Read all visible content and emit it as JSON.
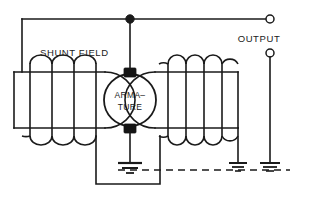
{
  "diagram": {
    "type": "electrical-schematic",
    "background_color": "#ffffff",
    "line_color": "#1a1a1a",
    "labels": {
      "shunt_field": "SHUNT FIELD",
      "output": "OUTPUT",
      "armature_line1": "ARMA–",
      "armature_line2": "TURE"
    },
    "components": {
      "armature": {
        "name": "ARMATURE",
        "shape": "circle",
        "center_x": 130,
        "center_y": 100,
        "radius": 26,
        "brush_top": "brush-top",
        "brush_bottom": "brush-bottom"
      },
      "shunt_field_coil": {
        "name": "SHUNT FIELD",
        "turns": 4,
        "position": "left"
      },
      "series_field_coil": {
        "name": "field coil",
        "turns": 5,
        "position": "right"
      },
      "terminals": [
        {
          "name": "output-terminal-top",
          "kind": "open-circle",
          "x": 270,
          "y": 19
        },
        {
          "name": "output-terminal-bottom",
          "kind": "open-circle",
          "x": 270,
          "y": 53
        }
      ],
      "junctions": [
        {
          "name": "top-bus-junction",
          "kind": "filled-dot",
          "x": 130,
          "y": 19
        }
      ],
      "grounds": [
        {
          "name": "ground-armature",
          "x": 130,
          "y": 167
        },
        {
          "name": "ground-field-coil",
          "x": 243,
          "y": 167
        },
        {
          "name": "ground-output",
          "x": 270,
          "y": 167
        }
      ],
      "chassis_return": {
        "name": "chassis-return-dashed",
        "style": "dashed",
        "y": 170,
        "x_start": 118,
        "x_end": 290
      }
    }
  }
}
